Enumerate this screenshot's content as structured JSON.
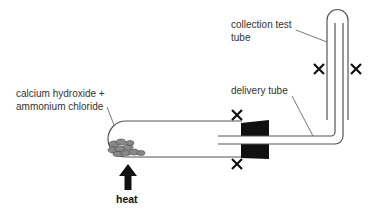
{
  "diagram": {
    "labels": {
      "reagents_line1": "calcium hydroxide +",
      "reagents_line2": "ammonium chloride",
      "collection_line1": "collection test",
      "collection_line2": "tube",
      "delivery": "delivery tube",
      "heat": "heat"
    },
    "components": [
      "boiling tube",
      "rubber stopper",
      "delivery tube",
      "collection test tube",
      "solid reagents",
      "heat arrow"
    ],
    "markers": {
      "cross_count": 4,
      "symbol": "X"
    },
    "colors": {
      "line": "#555555",
      "stopper": "#111111",
      "solid": "#777777",
      "text": "#333333"
    }
  }
}
